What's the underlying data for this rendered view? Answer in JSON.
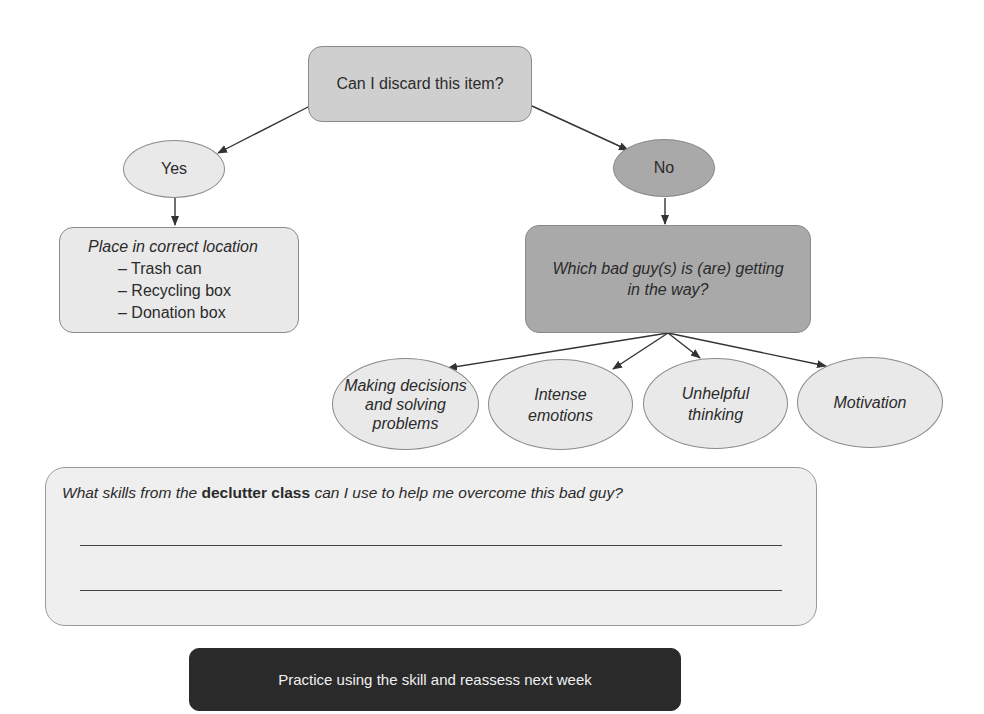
{
  "diagram": {
    "root": {
      "label": "Can I discard this item?"
    },
    "yes": {
      "label": "Yes"
    },
    "no": {
      "label": "No"
    },
    "yes_action": {
      "title": "Place in correct location",
      "items": [
        "– Trash can",
        "– Recycling box",
        "– Donation box"
      ]
    },
    "no_question": {
      "label": "Which bad guy(s) is (are) getting in the way?"
    },
    "bad_guys": [
      {
        "label": "Making decisions and solving problems"
      },
      {
        "label": "Intense emotions"
      },
      {
        "label": "Unhelpful thinking"
      },
      {
        "label": "Motivation"
      }
    ],
    "skills_prompt": {
      "before": "What skills from the ",
      "bold": "declutter class",
      "after": " can I use to help me overcome this bad guy?",
      "answer_lines": 2
    },
    "final_step": {
      "label": "Practice using the skill and reassess next week"
    },
    "colors": {
      "light_fill": "#e9e9e9",
      "root_fill": "#cfcfcf",
      "no_fill": "#a9a9a9",
      "final_fill": "#2a2a2a",
      "stroke": "#8a8a8a"
    }
  }
}
